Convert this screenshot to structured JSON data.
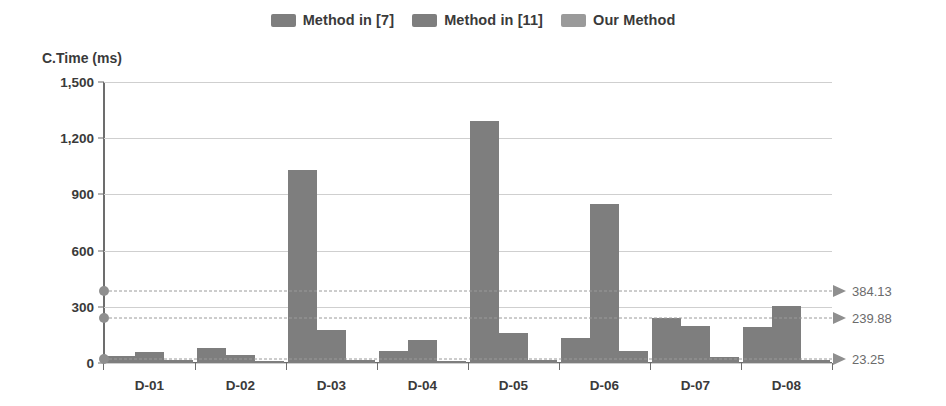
{
  "chart_data": {
    "type": "bar",
    "title": "",
    "subtitle": "",
    "xlabel": "",
    "ylabel": "C.Time (ms)",
    "ylim": [
      0,
      1500
    ],
    "yticks": [
      0,
      300,
      600,
      900,
      1200,
      1500
    ],
    "ytick_labels": [
      "0",
      "300",
      "600",
      "900",
      "1,200",
      "1,500"
    ],
    "grid": true,
    "legend_position": "top-center",
    "categories": [
      "D-01",
      "D-02",
      "D-03",
      "D-04",
      "D-05",
      "D-06",
      "D-07",
      "D-08"
    ],
    "series": [
      {
        "name": "Method in [7]",
        "color": "#7e7e7e",
        "values": [
          40,
          80,
          1030,
          65,
          1290,
          135,
          240,
          190
        ]
      },
      {
        "name": "Method in [11]",
        "color": "#7e7e7e",
        "values": [
          60,
          45,
          175,
          125,
          160,
          850,
          200,
          305
        ]
      },
      {
        "name": "Our Method",
        "color": "#7e7e7e",
        "values": [
          18,
          12,
          14,
          10,
          16,
          65,
          30,
          14
        ]
      }
    ],
    "reference_lines": [
      {
        "label": "384.13",
        "value": 384.13
      },
      {
        "label": "239.88",
        "value": 239.88
      },
      {
        "label": "23.25",
        "value": 23.25
      }
    ]
  },
  "legend": {
    "items": [
      {
        "label": "Method in [7]",
        "color": "#7e7e7e"
      },
      {
        "label": "Method in [11]",
        "color": "#7e7e7e"
      },
      {
        "label": "Our Method",
        "color": "#9a9a9a"
      }
    ]
  },
  "axis": {
    "y_title": "C.Time (ms)"
  }
}
